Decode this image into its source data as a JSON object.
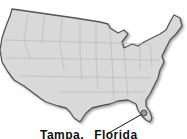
{
  "map": {
    "region": "Contiguous United States",
    "fill_color": "#d9d9d9",
    "border_color": "#555555",
    "state_line_color": "#bcbcbc",
    "marker": {
      "location": "Florida",
      "color": "#999999"
    },
    "label": {
      "city": "Tampa,",
      "state": "Florida"
    }
  }
}
